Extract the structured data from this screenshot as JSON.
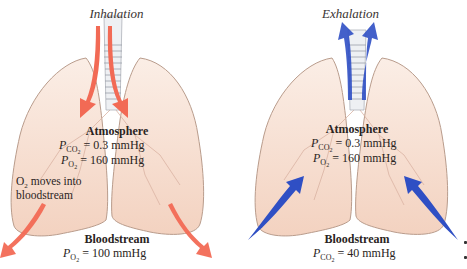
{
  "left_panel": {
    "title": "Inhalation",
    "atmosphere": {
      "heading": "Atmosphere",
      "pco2_symbol": "P",
      "pco2_sub": "CO",
      "pco2_sub2": "2",
      "pco2_value": "= 0.3 mmHg",
      "po2_symbol": "P",
      "po2_sub": "O",
      "po2_sub2": "2",
      "po2_value": "= 160 mmHg"
    },
    "note_line1_prefix": "O",
    "note_line1_sub": "2",
    "note_line1_rest": " moves into",
    "note_line2": "bloodstream",
    "bloodstream": {
      "heading": "Bloodstream",
      "symbol": "P",
      "sub": "O",
      "sub2": "2",
      "value": "= 100 mmHg"
    },
    "arrow_color": "#f26a55"
  },
  "right_panel": {
    "title": "Exhalation",
    "atmosphere": {
      "heading": "Atmosphere",
      "pco2_symbol": "P",
      "pco2_sub": "CO",
      "pco2_sub2": "2",
      "pco2_value": "= 0.3 mmHg",
      "po2_symbol": "P",
      "po2_sub": "O",
      "po2_sub2": "2",
      "po2_value": "= 160 mmHg"
    },
    "bloodstream": {
      "heading": "Bloodstream",
      "symbol": "P",
      "sub": "CO",
      "sub2": "2",
      "value": "= 40 mmHg"
    },
    "arrow_color": "#2f4fc4"
  },
  "colors": {
    "lung_fill": "#f6dccd",
    "lung_stroke": "#b99c8c",
    "trachea_fill": "#eef0f3",
    "text": "#2a2422"
  }
}
